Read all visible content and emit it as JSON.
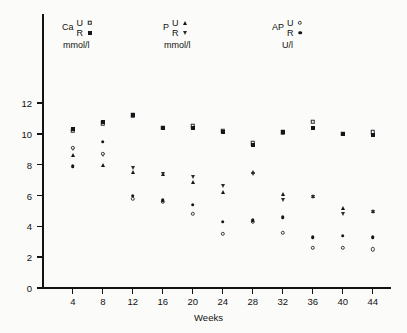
{
  "figure": {
    "background_color": "#fbfbf9",
    "ink_color": "#131316"
  },
  "legend": {
    "groups": [
      {
        "name": "Ca",
        "units": "mmol/l",
        "entries": [
          {
            "key": "U",
            "marker": "open-square-icon"
          },
          {
            "key": "R",
            "marker": "filled-square-icon"
          }
        ]
      },
      {
        "name": "P",
        "units": "mmol/l",
        "entries": [
          {
            "key": "U",
            "marker": "filled-triangle-icon"
          },
          {
            "key": "R",
            "marker": "down-triangle-icon"
          }
        ]
      },
      {
        "name": "AP",
        "units": "U/l",
        "entries": [
          {
            "key": "U",
            "marker": "open-circle-icon"
          },
          {
            "key": "R",
            "marker": "filled-circle-icon"
          }
        ]
      }
    ]
  },
  "chart_data": {
    "type": "scatter",
    "title": "",
    "xlabel": "Weeks",
    "ylabel": "",
    "xlim": [
      0,
      48
    ],
    "ylim": [
      0,
      13
    ],
    "grid": false,
    "legend_position": "top",
    "x": [
      4,
      8,
      12,
      16,
      20,
      24,
      28,
      32,
      36,
      40,
      44
    ],
    "xticks": [
      4,
      8,
      12,
      16,
      20,
      24,
      28,
      32,
      36,
      40,
      44
    ],
    "yticks": [
      0,
      2,
      4,
      6,
      8,
      10,
      12
    ],
    "series": [
      {
        "name": "Ca U",
        "label": "Ca U",
        "units": "mmol/l",
        "marker": "open-square-icon",
        "values": [
          10.2,
          10.7,
          11.2,
          10.4,
          10.5,
          10.2,
          9.4,
          10.1,
          10.8,
          10.0,
          10.1
        ]
      },
      {
        "name": "Ca R",
        "label": "Ca R",
        "units": "mmol/l",
        "marker": "filled-square-icon",
        "values": [
          10.3,
          10.8,
          11.2,
          10.4,
          10.4,
          10.1,
          9.3,
          10.1,
          10.4,
          10.0,
          9.9
        ]
      },
      {
        "name": "P U",
        "label": "P U",
        "units": "mmol/l",
        "marker": "filled-triangle-icon",
        "values": [
          8.6,
          8.0,
          7.5,
          7.4,
          6.9,
          6.2,
          7.5,
          6.1,
          6.0,
          5.2,
          5.0
        ]
      },
      {
        "name": "P R",
        "label": "P R",
        "units": "mmol/l",
        "marker": "down-triangle-icon",
        "values": [
          9.0,
          8.6,
          7.8,
          7.4,
          7.2,
          6.6,
          7.4,
          5.7,
          5.9,
          4.8,
          4.9
        ]
      },
      {
        "name": "AP U",
        "label": "AP U",
        "units": "U/l",
        "marker": "open-circle-icon",
        "values": [
          9.1,
          8.7,
          5.8,
          5.6,
          4.8,
          3.5,
          4.3,
          3.6,
          2.6,
          2.6,
          2.5
        ]
      },
      {
        "name": "AP R",
        "label": "AP R",
        "units": "U/l",
        "marker": "filled-circle-icon",
        "values": [
          7.9,
          9.5,
          6.0,
          5.7,
          5.4,
          4.3,
          4.4,
          4.6,
          3.3,
          3.4,
          3.3
        ]
      }
    ]
  }
}
